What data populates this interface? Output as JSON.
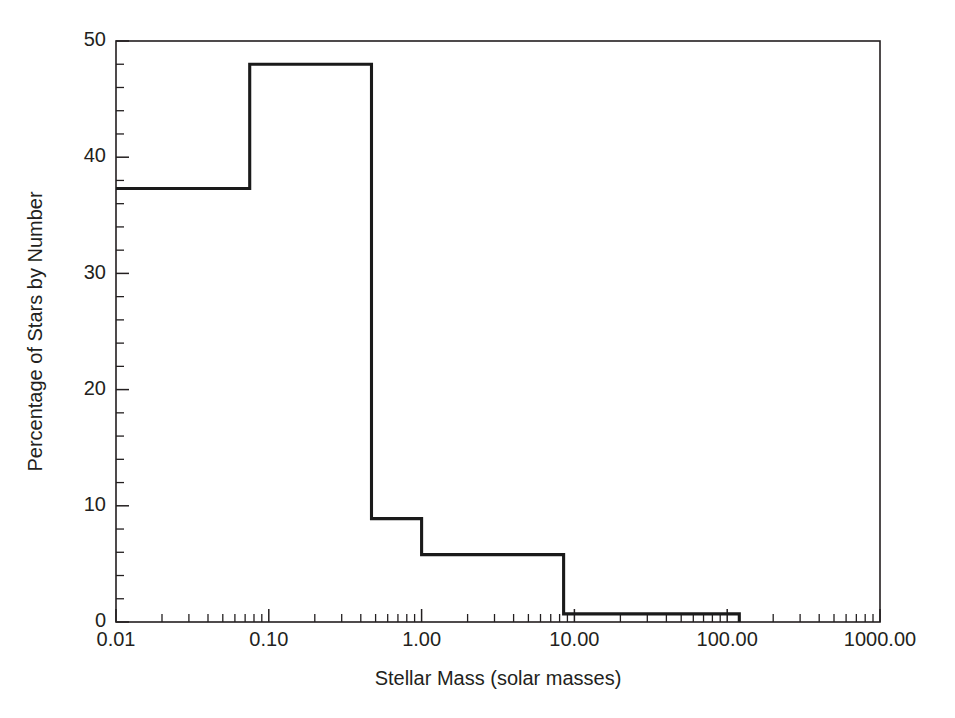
{
  "chart_data": {
    "type": "line",
    "title": "",
    "subtitle": "",
    "xlabel": "Stellar Mass (solar masses)",
    "ylabel": "Percentage of Stars by Number",
    "xscale": "log",
    "yscale": "linear",
    "xlim": [
      0.01,
      1000.0
    ],
    "ylim": [
      0,
      50
    ],
    "grid": false,
    "legend": null,
    "xticks": [
      0.01,
      0.1,
      1.0,
      10.0,
      100.0,
      1000.0
    ],
    "xtick_labels": [
      "0.01",
      "0.10",
      "1.00",
      "10.00",
      "100.00",
      "1000.00"
    ],
    "yticks": [
      0,
      10,
      20,
      30,
      40,
      50
    ],
    "ytick_labels": [
      "0",
      "10",
      "20",
      "30",
      "40",
      "50"
    ],
    "y_minor_tick_step": 2,
    "x_minor_ticks_per_decade": 9,
    "series": [
      {
        "name": "Stellar mass distribution",
        "style": "step-histogram",
        "color": "#1a1a1a",
        "bins": [
          {
            "x_start": 0.01,
            "x_end": 0.075,
            "value": 37.3
          },
          {
            "x_start": 0.075,
            "x_end": 0.47,
            "value": 48.0
          },
          {
            "x_start": 0.47,
            "x_end": 1.0,
            "value": 8.9
          },
          {
            "x_start": 1.0,
            "x_end": 8.5,
            "value": 5.8
          },
          {
            "x_start": 8.5,
            "x_end": 120.0,
            "value": 0.7
          }
        ]
      }
    ],
    "annotations": []
  },
  "figure": {
    "background_color": "#ffffff",
    "line_color": "#1a1a1a",
    "text_color": "#231f20",
    "plot_area": {
      "left": 116,
      "top": 41,
      "right": 880,
      "bottom": 622
    }
  }
}
